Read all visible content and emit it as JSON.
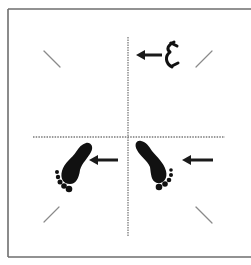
{
  "diagram": {
    "title": "",
    "colors": {
      "background": "#ffffff",
      "frame": "#6e6e6e",
      "axis": "#7a7a7a",
      "tick": "#8a8a8a",
      "icon": "#111111",
      "arrow": "#1a1a1a"
    },
    "elements": {
      "frame": {
        "sides": [
          "left",
          "top",
          "bottom"
        ]
      },
      "vertical_axis": {
        "style": "dotted",
        "x": 128
      },
      "horizontal_axis": {
        "style": "dotted",
        "y": 137
      },
      "corner_ticks": [
        "top-left",
        "top-right",
        "bottom-left",
        "bottom-right"
      ],
      "icons": [
        {
          "name": "head-icon",
          "quadrant": "top-right",
          "arrow": "left"
        },
        {
          "name": "left-foot-icon",
          "quadrant": "bottom-left",
          "arrow": "left"
        },
        {
          "name": "right-foot-icon",
          "quadrant": "bottom-right",
          "arrow": "left"
        }
      ]
    }
  }
}
